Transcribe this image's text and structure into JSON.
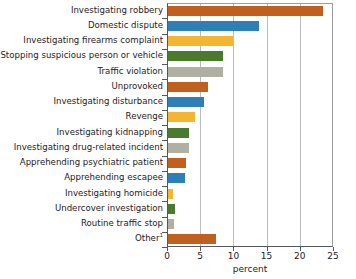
{
  "chart_data": {
    "type": "bar",
    "orientation": "horizontal",
    "title": "",
    "xlabel": "percent",
    "ylabel": "",
    "xlim": [
      0,
      25
    ],
    "xticks": [
      0,
      5,
      10,
      15,
      20,
      25
    ],
    "grid": true,
    "legend": "none",
    "categories": [
      "Investigating robbery",
      "Domestic dispute",
      "Investigating firearms complaint",
      "Stopping suspicious person or vehicle",
      "Traffic violation",
      "Unprovoked",
      "Investigating disturbance",
      "Revenge",
      "Investigating kidnapping",
      "Investigating drug-related incident",
      "Apprehending psychiatric patient",
      "Apprehending escapee",
      "Investigating homicide",
      "Undercover investigation",
      "Routine traffic stop",
      "Other"
    ],
    "category_footnotes": {
      "Other": "1"
    },
    "values": [
      23.3,
      13.7,
      9.8,
      8.3,
      8.3,
      6.0,
      5.4,
      4.1,
      3.2,
      3.2,
      2.7,
      2.6,
      0.8,
      1.0,
      0.9,
      7.2
    ],
    "colors": [
      "#c0601f",
      "#2e7eb8",
      "#f2b632",
      "#4a7a2d",
      "#b0b0a0",
      "#c0601f",
      "#2e7eb8",
      "#f2b632",
      "#4a7a2d",
      "#b0b0a0",
      "#c0601f",
      "#2e7eb8",
      "#f2b632",
      "#4a7a2d",
      "#b0b0a0",
      "#c0601f"
    ]
  },
  "palette": {
    "orange": "#c0601f",
    "blue": "#2e7eb8",
    "yellow": "#f2b632",
    "green": "#4a7a2d",
    "gray": "#b0b0a0",
    "axis": "#55585c",
    "grid": "#b9bcc0",
    "text": "#1f2124",
    "background": "#ffffff"
  }
}
